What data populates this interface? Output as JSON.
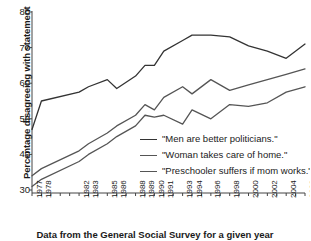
{
  "chart_data": {
    "type": "line",
    "title": "",
    "xlabel": "",
    "ylabel": "Percentage disagreeing with statement",
    "caption": "Data from the General Social Survey for a given year",
    "ylim": [
      30,
      80
    ],
    "yticks": [
      30,
      40,
      50,
      60,
      70,
      80
    ],
    "ytick_labels": [
      "30",
      "40",
      "50",
      "60",
      "70",
      "80"
    ],
    "grid": false,
    "legend_position": "inside-bottom-right",
    "xlim": [
      1977,
      2006
    ],
    "x": [
      1977,
      1978,
      1982,
      1983,
      1985,
      1986,
      1988,
      1989,
      1990,
      1991,
      1993,
      1994,
      1996,
      1998,
      2000,
      2002,
      2004,
      2006
    ],
    "xtick_labels": [
      "1977",
      "1978",
      "1982",
      "1983",
      "1985",
      "1986",
      "1988",
      "1989",
      "1990",
      "1991",
      "1993",
      "1994",
      "1996",
      "1998",
      "2000",
      "2002",
      "2004",
      "2006"
    ],
    "series": [
      {
        "name": "\"Men are better politicians.\"",
        "color": "#333333",
        "values": [
          47,
          55,
          57.5,
          59,
          61,
          58.5,
          62,
          65,
          65,
          69,
          72,
          73.5,
          73.5,
          73,
          70.5,
          69,
          67,
          71
        ]
      },
      {
        "name": "\"Woman takes care of home.\"",
        "color": "#555555",
        "values": [
          34,
          36,
          41,
          43,
          46,
          48,
          51,
          54,
          52.5,
          56,
          59,
          57,
          61,
          58,
          59.5,
          61,
          62.5,
          64
        ]
      },
      {
        "name": "\"Preschooler suffers if mom works.\"",
        "color": "#555555",
        "values": [
          31,
          33,
          38,
          40,
          43,
          45,
          48,
          51,
          50.5,
          51,
          48.5,
          52.5,
          50,
          54,
          53.5,
          54.5,
          57.5,
          59
        ]
      }
    ],
    "legend": [
      "\"Men are better politicians.\"",
      "\"Woman takes care of home.\"",
      "\"Preschooler suffers if mom works.\""
    ]
  },
  "axis": {
    "ylabel": "Percentage disagreeing with statement",
    "caption": "Data from the General Social Survey for a given year"
  }
}
